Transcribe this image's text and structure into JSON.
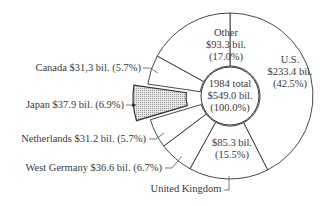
{
  "chart_data": {
    "type": "pie",
    "variant": "donut-with-exploded-slice",
    "center_label": [
      "1984 total",
      "$549.0 bil.",
      "(100.0%)"
    ],
    "total": 549.0,
    "unit": "billion USD",
    "slices": [
      {
        "name": "U.S.",
        "value": 233.4,
        "percent": 42.5,
        "label_lines": [
          "U.S.",
          "$233.4 bil.",
          "(42.5%)"
        ],
        "exploded": false,
        "fill": "#ffffff"
      },
      {
        "name": "United Kingdom",
        "value": 85.3,
        "percent": 15.5,
        "label_lines": [
          "$85.3 bil.",
          "(15.5%)"
        ],
        "callout": "United Kingdom",
        "exploded": false,
        "fill": "#ffffff"
      },
      {
        "name": "West Germany",
        "value": 36.6,
        "percent": 6.7,
        "callout": "West Germany $36.6 bil. (6.7%)",
        "exploded": false,
        "fill": "#ffffff"
      },
      {
        "name": "Netherlands",
        "value": 31.2,
        "percent": 5.7,
        "callout": "Netherlands $31.2 bil. (5.7%)",
        "exploded": false,
        "fill": "#ffffff"
      },
      {
        "name": "Japan",
        "value": 37.9,
        "percent": 6.9,
        "callout": "Japan $37.9 bil. (6.9%)",
        "exploded": true,
        "fill": "#d4d4d4"
      },
      {
        "name": "Canada",
        "value": 31.3,
        "percent": 5.7,
        "callout": "Canada $31,3 bil. (5.7%)",
        "exploded": false,
        "fill": "#ffffff"
      },
      {
        "name": "Other",
        "value": 93.3,
        "percent": 17.0,
        "label_lines": [
          "Other",
          "$93.3 bil.",
          "(17.0%)"
        ],
        "exploded": false,
        "fill": "#ffffff"
      }
    ],
    "title": "",
    "legend": "none (callout labels)"
  }
}
